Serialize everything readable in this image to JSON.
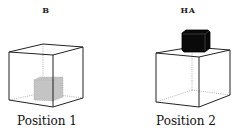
{
  "panels": [
    {
      "top_label": "B",
      "caption": "Position 1",
      "object": {
        "description": "gray cube inside box, resting on floor",
        "color": "#bdbdbd"
      }
    },
    {
      "top_label": "HA",
      "caption": "Position 2",
      "object": {
        "description": "black cube on top of box",
        "color": "#0a0a0a"
      }
    }
  ],
  "colors": {
    "line": "#222222",
    "hidden_line": "#9a9a9a",
    "gray_cube": "#bdbdbd",
    "black_cube": "#0a0a0a"
  }
}
